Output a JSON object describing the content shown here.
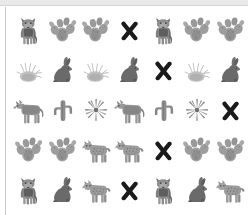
{
  "canvas": {
    "width": 248,
    "height": 215,
    "background_color": "#ffffff",
    "top_band_color": "#e9e9e9",
    "left_rule_color": "#c9c9c9"
  },
  "palette": {
    "wolf_gray": "#8a8a8a",
    "wolf_dark": "#5e5e5e",
    "coyote_gray": "#969696",
    "bobcat_gray": "#9a9a9a",
    "rabbit_gray": "#6f6f6f",
    "cactus_gray": "#a0a0a0",
    "cactus_dark": "#848484",
    "grass_gray": "#bdbdbd",
    "x_black": "#1a1a1a"
  },
  "grid": {
    "columns": 7,
    "rows": 5,
    "cell_width": 33.7,
    "cell_height": 40,
    "icon_legend": [
      {
        "key": "wolf",
        "label": "wolf"
      },
      {
        "key": "coyote",
        "label": "coyote"
      },
      {
        "key": "bobcat",
        "label": "bobcat"
      },
      {
        "key": "jackrabbit",
        "label": "jackrabbit"
      },
      {
        "key": "prickly-pear",
        "label": "prickly pear cactus"
      },
      {
        "key": "saguaro",
        "label": "saguaro cactus"
      },
      {
        "key": "agave",
        "label": "agave"
      },
      {
        "key": "grass",
        "label": "desert grass"
      },
      {
        "key": "x-mark",
        "label": "x mark"
      }
    ],
    "cells": [
      [
        "wolf",
        "prickly-pear",
        "prickly-pear",
        "x-mark",
        "wolf",
        "prickly-pear",
        "prickly-pear"
      ],
      [
        "grass",
        "jackrabbit",
        "grass",
        "jackrabbit",
        "x-mark",
        "grass",
        "jackrabbit"
      ],
      [
        "coyote",
        "saguaro",
        "agave",
        "coyote",
        "saguaro",
        "agave",
        "x-mark"
      ],
      [
        "prickly-pear",
        "prickly-pear",
        "bobcat",
        "bobcat",
        "x-mark",
        "prickly-pear",
        "prickly-pear"
      ],
      [
        "wolf",
        "jackrabbit",
        "bobcat",
        "x-mark",
        "wolf",
        "jackrabbit",
        "bobcat"
      ]
    ]
  }
}
